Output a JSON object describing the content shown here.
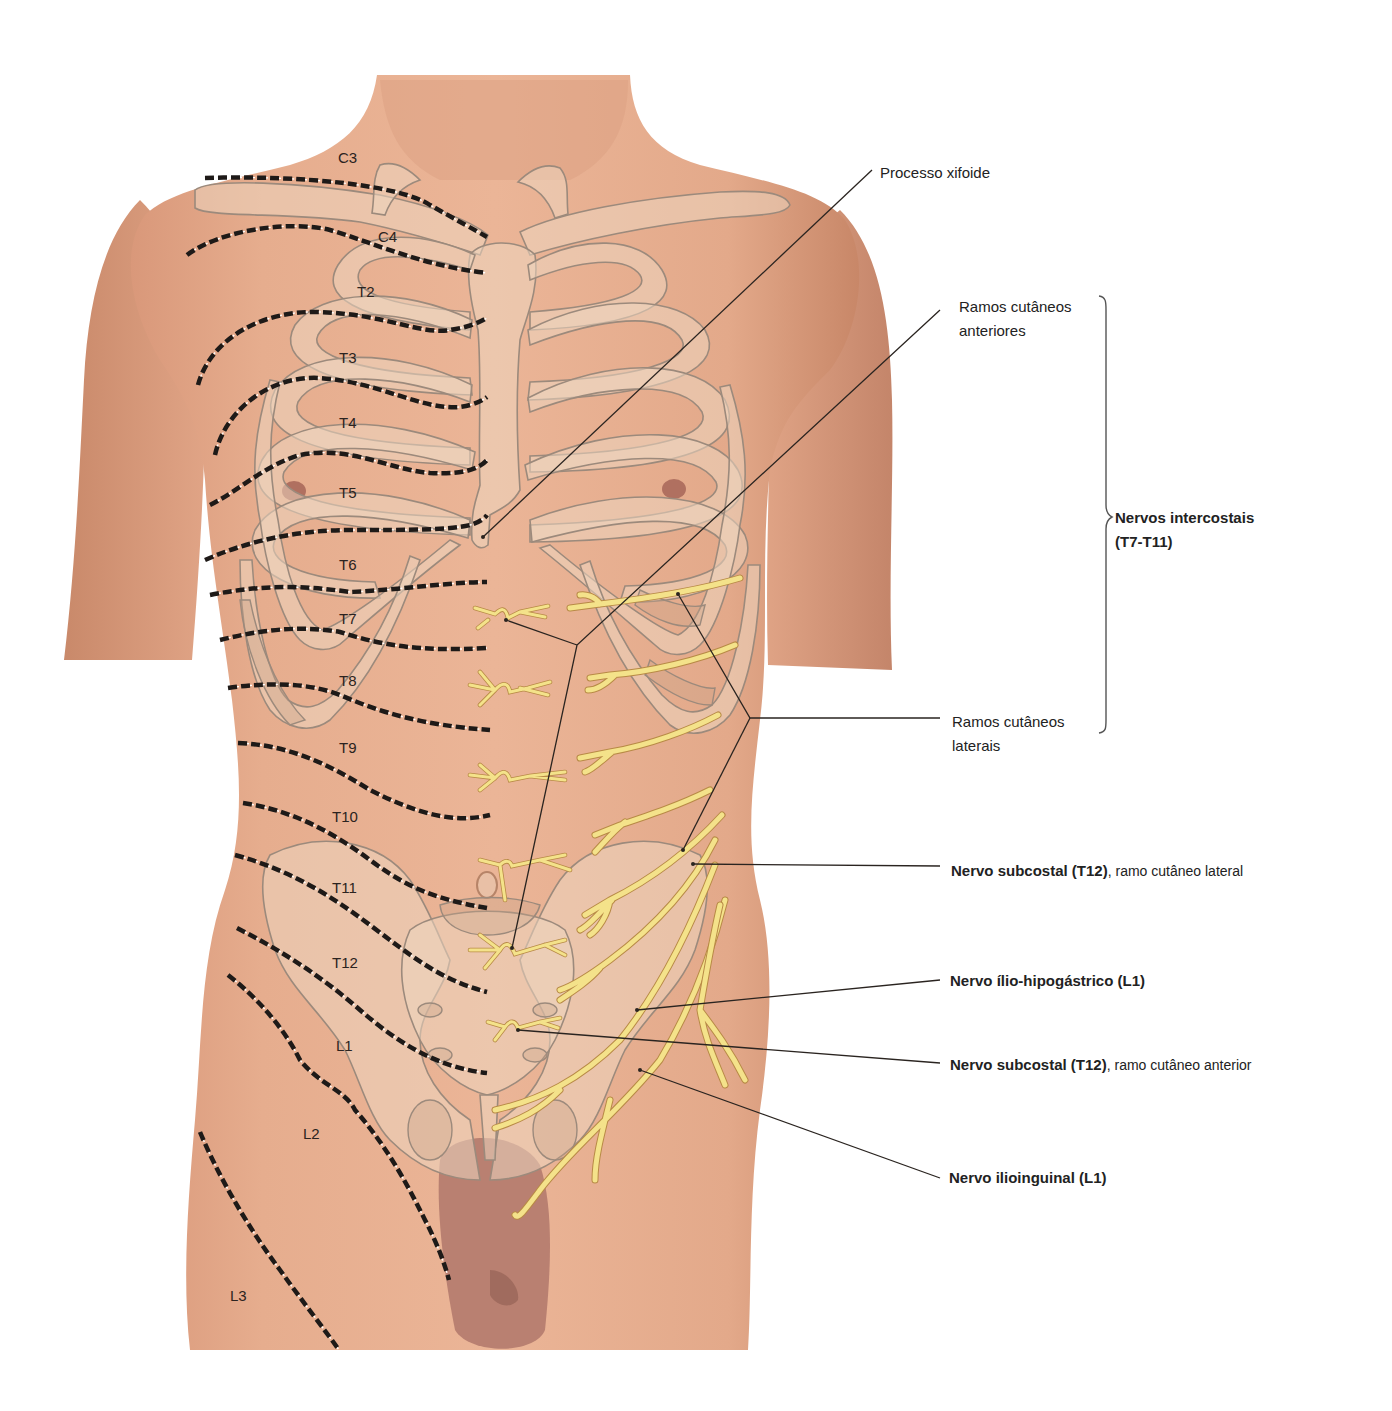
{
  "figure": {
    "colors": {
      "skin": "#e2a98a",
      "skin_shadow": "#c98a6c",
      "bone_overlay": "#ecd6c0",
      "bone_outline": "#9c8a7c",
      "nerve": "#f4e28a",
      "nerve_edge": "#b88a46",
      "dermatome_line": "#1e1a18",
      "leader_line": "#2a2420",
      "background": "#ffffff"
    }
  },
  "dermatomes": [
    {
      "id": "C3",
      "label": "C3"
    },
    {
      "id": "C4",
      "label": "C4"
    },
    {
      "id": "T2",
      "label": "T2"
    },
    {
      "id": "T3",
      "label": "T3"
    },
    {
      "id": "T4",
      "label": "T4"
    },
    {
      "id": "T5",
      "label": "T5"
    },
    {
      "id": "T6",
      "label": "T6"
    },
    {
      "id": "T7",
      "label": "T7"
    },
    {
      "id": "T8",
      "label": "T8"
    },
    {
      "id": "T9",
      "label": "T9"
    },
    {
      "id": "T10",
      "label": "T10"
    },
    {
      "id": "T11",
      "label": "T11"
    },
    {
      "id": "T12",
      "label": "T12"
    },
    {
      "id": "L1",
      "label": "L1"
    },
    {
      "id": "L2",
      "label": "L2"
    },
    {
      "id": "L3",
      "label": "L3"
    }
  ],
  "labels": {
    "processo_xifoide": "Processo xifoide",
    "ramos_anteriores_line1": "Ramos cutâneos",
    "ramos_anteriores_line2": "anteriores",
    "intercostais_line1": "Nervos intercostais",
    "intercostais_line2": "(T7-T11)",
    "ramos_laterais_line1": "Ramos cutâneos",
    "ramos_laterais_line2": "laterais",
    "subcostal_lateral_bold": "Nervo subcostal (T12)",
    "subcostal_lateral_rest": ", ramo cutâneo lateral",
    "ilio_hipogastrico": "Nervo ílio-hipogástrico (L1)",
    "subcostal_anterior_bold": "Nervo subcostal (T12)",
    "subcostal_anterior_rest": ", ramo cutâneo anterior",
    "ilioinguinal": "Nervo ilioinguinal (L1)"
  }
}
